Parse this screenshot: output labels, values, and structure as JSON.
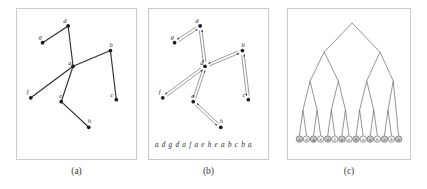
{
  "figure": {
    "panels": [
      {
        "id": "a",
        "caption": "(a)",
        "kind": "undirected-graph",
        "description": "undirected tree drawn with labelled vertices and straight edges",
        "vertices": [
          {
            "label": "a",
            "x": 57,
            "y": 58,
            "label_dx": -5,
            "label_dy": -1
          },
          {
            "label": "b",
            "x": 95,
            "y": 42,
            "label_dx": -1,
            "label_dy": -4
          },
          {
            "label": "c",
            "x": 101,
            "y": 92,
            "label_dx": -6,
            "label_dy": -3
          },
          {
            "label": "d",
            "x": 52,
            "y": 17,
            "label_dx": -5,
            "label_dy": -3
          },
          {
            "label": "e",
            "x": 45,
            "y": 94,
            "label_dx": -2,
            "label_dy": -4
          },
          {
            "label": "f",
            "x": 14,
            "y": 90,
            "label_dx": -4,
            "label_dy": -4
          },
          {
            "label": "g",
            "x": 26,
            "y": 34,
            "label_dx": -4,
            "label_dy": -4
          },
          {
            "label": "h",
            "x": 73,
            "y": 120,
            "label_dx": -1,
            "label_dy": -4
          }
        ],
        "edges": [
          {
            "from": "a",
            "to": "d"
          },
          {
            "from": "a",
            "to": "f"
          },
          {
            "from": "a",
            "to": "e"
          },
          {
            "from": "a",
            "to": "b"
          },
          {
            "from": "d",
            "to": "g"
          },
          {
            "from": "b",
            "to": "c"
          },
          {
            "from": "e",
            "to": "h"
          }
        ]
      },
      {
        "id": "b",
        "caption": "(b)",
        "kind": "euler-tour-directed-graph",
        "description": "same tree with every edge doubled into two opposite directed arcs forming the Euler tour",
        "vertices": [
          {
            "label": "a",
            "x": 57,
            "y": 58,
            "label_dx": -5,
            "label_dy": -1
          },
          {
            "label": "b",
            "x": 95,
            "y": 42,
            "label_dx": -1,
            "label_dy": -4
          },
          {
            "label": "c",
            "x": 101,
            "y": 92,
            "label_dx": -6,
            "label_dy": -3
          },
          {
            "label": "d",
            "x": 52,
            "y": 17,
            "label_dx": -5,
            "label_dy": -3
          },
          {
            "label": "e",
            "x": 45,
            "y": 94,
            "label_dx": -2,
            "label_dy": -4
          },
          {
            "label": "f",
            "x": 14,
            "y": 90,
            "label_dx": -4,
            "label_dy": -4
          },
          {
            "label": "g",
            "x": 26,
            "y": 34,
            "label_dx": -4,
            "label_dy": -4
          },
          {
            "label": "h",
            "x": 73,
            "y": 120,
            "label_dx": -1,
            "label_dy": -4
          }
        ],
        "edges": [
          {
            "from": "a",
            "to": "d"
          },
          {
            "from": "a",
            "to": "f"
          },
          {
            "from": "a",
            "to": "e"
          },
          {
            "from": "a",
            "to": "b"
          },
          {
            "from": "d",
            "to": "g"
          },
          {
            "from": "b",
            "to": "c"
          },
          {
            "from": "e",
            "to": "h"
          }
        ],
        "sequence_label": "a d g d a f a e h e a b c b a",
        "sequence": [
          "a",
          "d",
          "g",
          "d",
          "a",
          "f",
          "a",
          "e",
          "h",
          "e",
          "a",
          "b",
          "c",
          "b",
          "a"
        ]
      },
      {
        "id": "c",
        "caption": "(c)",
        "kind": "binary-tree-over-sequence",
        "description": "balanced binary (segment) tree built over the 15 element Euler tour sequence; leaves are circled letters",
        "leaves": [
          "a",
          "d",
          "g",
          "d",
          "a",
          "f",
          "a",
          "e",
          "h",
          "e",
          "a",
          "b",
          "c",
          "b",
          "a"
        ],
        "levels": 5
      }
    ]
  }
}
